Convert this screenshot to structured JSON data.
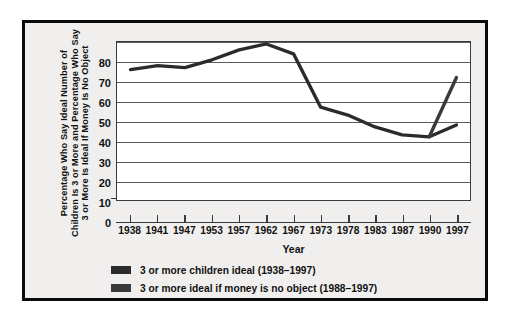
{
  "chart_data": {
    "type": "line",
    "title": "",
    "xlabel": "Year",
    "ylabel": "Percentage  Who Say Ideal Number of Children Is 3 or More and Percentage  Who Say 3 or More Is Ideal If Money Is No Object",
    "ylabel_lines": [
      "Percentage  Who Say Ideal Number of",
      "Children Is 3 or More and Percentage  Who Say",
      "3 or More Is Ideal If Money Is No Object"
    ],
    "xlim": [
      1938,
      1997
    ],
    "ylim": [
      0,
      80
    ],
    "grid": true,
    "legend_position": "below-axis-left",
    "categories": [
      "1938",
      "1941",
      "1947",
      "1953",
      "1957",
      "1962",
      "1967",
      "1973",
      "1978",
      "1983",
      "1987",
      "1990",
      "1997"
    ],
    "x_tick_labels": [
      "1938",
      "1941",
      "1947",
      "1953",
      "1957",
      "1962",
      "1967",
      "1973",
      "1978",
      "1983",
      "1987",
      "1990",
      "1997"
    ],
    "y_tick_labels": [
      "80",
      "70",
      "60",
      "50",
      "40",
      "30",
      "20",
      "10",
      "0"
    ],
    "y_ticks": [
      80,
      70,
      60,
      50,
      40,
      30,
      20,
      10,
      0
    ],
    "series": [
      {
        "name": "3 or more children ideal (1938–1997)",
        "color": "#2b2b2b",
        "x": [
          1938,
          1941,
          1947,
          1953,
          1957,
          1962,
          1967,
          1973,
          1978,
          1983,
          1987,
          1990,
          1997
        ],
        "values": [
          66,
          68,
          67,
          71,
          76,
          79,
          74,
          47,
          43,
          37,
          33,
          32,
          38
        ]
      },
      {
        "name": "3 or more ideal if money is no object (1988–1997)",
        "color": "#3a3a3a",
        "x": [
          1990,
          1997
        ],
        "values": [
          32,
          62
        ]
      }
    ]
  },
  "legend": {
    "items": [
      {
        "label": "3 or more children ideal (1938–1997)",
        "color": "#2b2b2b"
      },
      {
        "label": "3 or more ideal if money is no object (1988–1997)",
        "color": "#3a3a3a"
      }
    ]
  },
  "colors": {
    "frame": "#0a0a0a",
    "figure_background": "#f0efed",
    "plot_background": "#ffffff",
    "gridline": "#5b5b5b",
    "axis": "#3a3a3a",
    "text": "#111111"
  }
}
